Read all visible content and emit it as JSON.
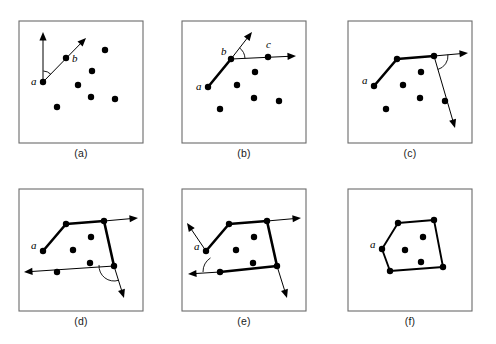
{
  "figure": {
    "background_color": "#ffffff",
    "frame_color": "#6b6b6b",
    "ink_color": "#000000",
    "panel_count": 6,
    "columns": 3,
    "rows": 2
  },
  "panels": [
    {
      "id": "a",
      "caption": "(a)",
      "frame": {
        "x": 19,
        "y": 21,
        "w": 124,
        "h": 122
      },
      "point_labels": [
        "a",
        "b"
      ],
      "points": [
        {
          "name": "a",
          "x": 43,
          "y": 82,
          "label": "a",
          "label_x": 31,
          "label_y": 85,
          "r": 3.2
        },
        {
          "name": "b",
          "x": 66,
          "y": 58,
          "label": "b",
          "label_x": 72,
          "label_y": 62,
          "r": 3.2
        },
        {
          "name": "p3",
          "x": 78,
          "y": 85,
          "label": "",
          "r": 3.2
        },
        {
          "name": "p4",
          "x": 92,
          "y": 71,
          "label": "",
          "r": 3.2
        },
        {
          "name": "p5",
          "x": 105,
          "y": 50,
          "label": "",
          "r": 3.2
        },
        {
          "name": "p6",
          "x": 91,
          "y": 97,
          "label": "",
          "r": 3.2
        },
        {
          "name": "p7",
          "x": 115,
          "y": 99,
          "label": "",
          "r": 3.2
        },
        {
          "name": "p8",
          "x": 57,
          "y": 107,
          "label": "",
          "r": 3.2
        }
      ],
      "rays": [
        {
          "name": "vertical-up-ray",
          "x1": 43,
          "y1": 82,
          "x2": 43,
          "y2": 32,
          "arrow": true,
          "weight": "thin"
        },
        {
          "name": "sweep-ray-to-b",
          "x1": 43,
          "y1": 82,
          "x2": 86,
          "y2": 38,
          "arrow": true,
          "weight": "thin"
        }
      ],
      "angle_arc": {
        "name": "angle-at-a",
        "cx": 43,
        "cy": 82,
        "r": 11,
        "a1": 272,
        "a2": 315
      },
      "hull_path": []
    },
    {
      "id": "b",
      "caption": "(b)",
      "frame": {
        "x": 182,
        "y": 21,
        "w": 124,
        "h": 122
      },
      "point_labels": [
        "a",
        "b",
        "c"
      ],
      "points": [
        {
          "name": "a",
          "x": 208,
          "y": 87,
          "label": "a",
          "label_x": 196,
          "label_y": 90,
          "r": 3.2
        },
        {
          "name": "b",
          "x": 231,
          "y": 59,
          "label": "b",
          "label_x": 221,
          "label_y": 55,
          "r": 3.2
        },
        {
          "name": "c",
          "x": 268,
          "y": 57,
          "label": "c",
          "label_x": 266,
          "label_y": 48,
          "r": 3.2
        },
        {
          "name": "p4",
          "x": 255,
          "y": 72,
          "label": "",
          "r": 3.2
        },
        {
          "name": "p5",
          "x": 237,
          "y": 85,
          "label": "",
          "r": 3.2
        },
        {
          "name": "p6",
          "x": 254,
          "y": 98,
          "label": "",
          "r": 3.2
        },
        {
          "name": "p7",
          "x": 279,
          "y": 101,
          "label": "",
          "r": 3.2
        },
        {
          "name": "p8",
          "x": 220,
          "y": 109,
          "label": "",
          "r": 3.2
        }
      ],
      "rays": [
        {
          "name": "prev-direction-ray",
          "x1": 231,
          "y1": 59,
          "x2": 252,
          "y2": 32,
          "arrow": true,
          "weight": "thin"
        },
        {
          "name": "sweep-ray-to-c",
          "x1": 231,
          "y1": 59,
          "x2": 296,
          "y2": 56,
          "arrow": true,
          "weight": "thin"
        }
      ],
      "angle_arc": {
        "name": "angle-at-b",
        "cx": 231,
        "cy": 59,
        "r": 14,
        "a1": 308,
        "a2": 357
      },
      "hull_path": [
        {
          "x": 208,
          "y": 87
        },
        {
          "x": 231,
          "y": 59
        }
      ]
    },
    {
      "id": "c",
      "caption": "(c)",
      "frame": {
        "x": 348,
        "y": 21,
        "w": 124,
        "h": 122
      },
      "point_labels": [
        "a"
      ],
      "points": [
        {
          "name": "a",
          "x": 374,
          "y": 86,
          "label": "a",
          "label_x": 362,
          "label_y": 84,
          "r": 3.2
        },
        {
          "name": "b",
          "x": 397,
          "y": 59,
          "label": "",
          "r": 3.2
        },
        {
          "name": "c",
          "x": 434,
          "y": 56,
          "label": "",
          "r": 3.2
        },
        {
          "name": "p4",
          "x": 421,
          "y": 72,
          "label": "",
          "r": 3.2
        },
        {
          "name": "p5",
          "x": 403,
          "y": 85,
          "label": "",
          "r": 3.2
        },
        {
          "name": "p6",
          "x": 420,
          "y": 98,
          "label": "",
          "r": 3.2
        },
        {
          "name": "p7",
          "x": 445,
          "y": 101,
          "label": "",
          "r": 3.2
        },
        {
          "name": "p8",
          "x": 386,
          "y": 109,
          "label": "",
          "r": 3.2
        }
      ],
      "rays": [
        {
          "name": "prev-direction-ray",
          "x1": 434,
          "y1": 56,
          "x2": 468,
          "y2": 53,
          "arrow": true,
          "weight": "thin"
        },
        {
          "name": "sweep-ray-down",
          "x1": 434,
          "y1": 56,
          "x2": 455,
          "y2": 128,
          "arrow": true,
          "weight": "thin"
        }
      ],
      "angle_arc": {
        "name": "angle-at-c",
        "cx": 434,
        "cy": 56,
        "r": 14,
        "a1": 354,
        "a2": 74
      },
      "hull_path": [
        {
          "x": 374,
          "y": 86
        },
        {
          "x": 397,
          "y": 59
        },
        {
          "x": 434,
          "y": 56
        }
      ]
    },
    {
      "id": "d",
      "caption": "(d)",
      "frame": {
        "x": 19,
        "y": 189,
        "w": 124,
        "h": 122
      },
      "point_labels": [
        "a"
      ],
      "points": [
        {
          "name": "a",
          "x": 43,
          "y": 251,
          "label": "a",
          "label_x": 31,
          "label_y": 249,
          "r": 3.2
        },
        {
          "name": "b",
          "x": 66,
          "y": 224,
          "label": "",
          "r": 3.2
        },
        {
          "name": "c",
          "x": 104,
          "y": 221,
          "label": "",
          "r": 3.2
        },
        {
          "name": "d",
          "x": 114,
          "y": 266,
          "label": "",
          "r": 3.2
        },
        {
          "name": "p5",
          "x": 91,
          "y": 237,
          "label": "",
          "r": 3.2
        },
        {
          "name": "p6",
          "x": 73,
          "y": 250,
          "label": "",
          "r": 3.2
        },
        {
          "name": "p7",
          "x": 90,
          "y": 263,
          "label": "",
          "r": 3.2
        },
        {
          "name": "p8",
          "x": 57,
          "y": 272,
          "label": "",
          "r": 3.2
        }
      ],
      "rays": [
        {
          "name": "prev-direction-ray",
          "x1": 104,
          "y1": 221,
          "x2": 138,
          "y2": 218,
          "arrow": true,
          "weight": "thin"
        },
        {
          "name": "sweep-ray-left",
          "x1": 114,
          "y1": 266,
          "x2": 24,
          "y2": 272,
          "arrow": true,
          "weight": "thin"
        },
        {
          "name": "sweep-ray-down-right",
          "x1": 114,
          "y1": 266,
          "x2": 124,
          "y2": 298,
          "arrow": true,
          "weight": "thin"
        }
      ],
      "angle_arc": {
        "name": "angle-at-d",
        "cx": 114,
        "cy": 266,
        "r": 15,
        "a1": 72,
        "a2": 184
      },
      "hull_path": [
        {
          "x": 43,
          "y": 251
        },
        {
          "x": 66,
          "y": 224
        },
        {
          "x": 104,
          "y": 221
        },
        {
          "x": 114,
          "y": 266
        }
      ]
    },
    {
      "id": "e",
      "caption": "(e)",
      "frame": {
        "x": 182,
        "y": 189,
        "w": 124,
        "h": 122
      },
      "point_labels": [
        "a"
      ],
      "points": [
        {
          "name": "a",
          "x": 206,
          "y": 251,
          "label": "a",
          "label_x": 194,
          "label_y": 250,
          "r": 3.2
        },
        {
          "name": "b",
          "x": 229,
          "y": 224,
          "label": "",
          "r": 3.2
        },
        {
          "name": "c",
          "x": 267,
          "y": 221,
          "label": "",
          "r": 3.2
        },
        {
          "name": "d",
          "x": 277,
          "y": 266,
          "label": "",
          "r": 3.2
        },
        {
          "name": "e",
          "x": 220,
          "y": 272,
          "label": "",
          "r": 3.2
        },
        {
          "name": "p6",
          "x": 254,
          "y": 237,
          "label": "",
          "r": 3.2
        },
        {
          "name": "p7",
          "x": 236,
          "y": 250,
          "label": "",
          "r": 3.2
        },
        {
          "name": "p8",
          "x": 253,
          "y": 263,
          "label": "",
          "r": 3.2
        }
      ],
      "rays": [
        {
          "name": "sweep-ray-up-left",
          "x1": 206,
          "y1": 251,
          "x2": 187,
          "y2": 223,
          "arrow": true,
          "weight": "thin"
        },
        {
          "name": "prev-direction-ray-left",
          "x1": 220,
          "y1": 272,
          "x2": 188,
          "y2": 274,
          "arrow": true,
          "weight": "thin"
        },
        {
          "name": "top-right-ray",
          "x1": 267,
          "y1": 221,
          "x2": 301,
          "y2": 218,
          "arrow": true,
          "weight": "thin"
        },
        {
          "name": "bottom-right-ray",
          "x1": 277,
          "y1": 266,
          "x2": 287,
          "y2": 298,
          "arrow": true,
          "weight": "thin"
        }
      ],
      "angle_arc": {
        "name": "angle-at-e",
        "cx": 220,
        "cy": 272,
        "r": 17,
        "a1": 180,
        "a2": 236
      },
      "hull_path": [
        {
          "x": 206,
          "y": 251
        },
        {
          "x": 229,
          "y": 224
        },
        {
          "x": 267,
          "y": 221
        },
        {
          "x": 277,
          "y": 266
        },
        {
          "x": 220,
          "y": 272
        }
      ]
    },
    {
      "id": "f",
      "caption": "(f)",
      "frame": {
        "x": 348,
        "y": 189,
        "w": 124,
        "h": 122
      },
      "point_labels": [
        "a"
      ],
      "points": [
        {
          "name": "a",
          "x": 382,
          "y": 249,
          "label": "a",
          "label_x": 370,
          "label_y": 248,
          "r": 3.2
        },
        {
          "name": "b",
          "x": 398,
          "y": 223,
          "label": "",
          "r": 3.2
        },
        {
          "name": "c",
          "x": 434,
          "y": 220,
          "label": "",
          "r": 3.2
        },
        {
          "name": "d",
          "x": 443,
          "y": 267,
          "label": "",
          "r": 3.2
        },
        {
          "name": "e",
          "x": 390,
          "y": 271,
          "label": "",
          "r": 3.2
        },
        {
          "name": "p6",
          "x": 423,
          "y": 237,
          "label": "",
          "r": 3.2
        },
        {
          "name": "p7",
          "x": 405,
          "y": 250,
          "label": "",
          "r": 3.2
        },
        {
          "name": "p8",
          "x": 421,
          "y": 262,
          "label": "",
          "r": 3.2
        }
      ],
      "rays": [],
      "angle_arc": null,
      "hull_path": [
        {
          "x": 382,
          "y": 249
        },
        {
          "x": 398,
          "y": 223
        },
        {
          "x": 434,
          "y": 220
        },
        {
          "x": 443,
          "y": 267
        },
        {
          "x": 390,
          "y": 271
        },
        {
          "x": 382,
          "y": 249
        }
      ]
    }
  ],
  "captions": {
    "a": "(a)",
    "b": "(b)",
    "c": "(c)",
    "d": "(d)",
    "e": "(e)",
    "f": "(f)"
  }
}
